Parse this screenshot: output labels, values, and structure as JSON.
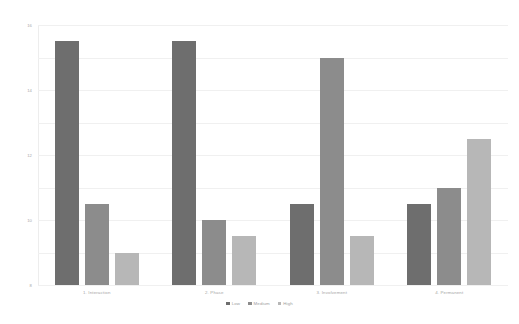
{
  "chart_data": {
    "type": "bar",
    "title": "",
    "subtitle": "",
    "xlabel": "",
    "ylabel": "",
    "ylim": [
      0,
      16
    ],
    "ytick_values": [
      0,
      2,
      4,
      6,
      8,
      10,
      12,
      14,
      16
    ],
    "ytick_labels": [
      "0",
      "2",
      "4",
      "6",
      "8",
      "10",
      "12",
      "14",
      "16"
    ],
    "grid": true,
    "legend_position": "bottom-center",
    "categories": [
      "1. Interaction",
      "2. Phase",
      "3. Involvement",
      "4. Permanent"
    ],
    "series": [
      {
        "name": "Low",
        "color": "#6e6e6e",
        "values": [
          15,
          15,
          5,
          5
        ]
      },
      {
        "name": "Medium",
        "color": "#8c8c8c",
        "values": [
          5,
          4,
          14,
          6
        ]
      },
      {
        "name": "High",
        "color": "#b7b7b7",
        "values": [
          2,
          3,
          3,
          9
        ]
      }
    ]
  },
  "colors": {
    "background": "#ffffff",
    "gridline": "#f0f0f0",
    "tick_text": "#a8a8a8",
    "legend_text": "#9d9d9d",
    "low": "#6e6e6e",
    "medium": "#8c8c8c",
    "high": "#b7b7b7"
  }
}
